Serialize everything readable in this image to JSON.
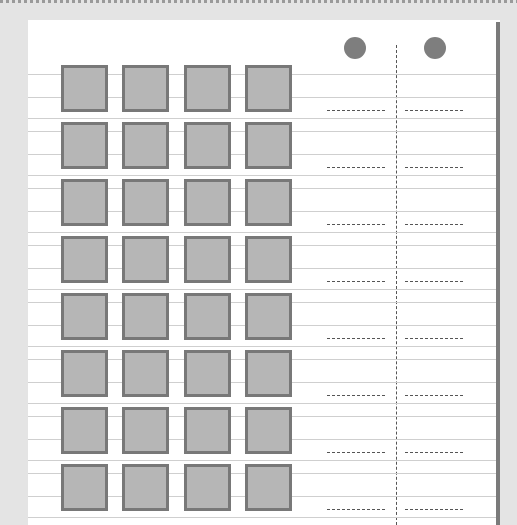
{
  "document": {
    "type": "scanned answer sheet",
    "header_marks": [
      "",
      ""
    ],
    "columns": {
      "square_columns": 4,
      "bubble_columns": 2
    },
    "rows": 8,
    "colors": {
      "page": "#ffffff",
      "background": "#e4e4e4",
      "square_fill": "#b6b6b6",
      "square_border": "#787878",
      "circle": "#7e7e7e",
      "rule_line": "#cfcfcf",
      "dash": "#555555"
    }
  }
}
